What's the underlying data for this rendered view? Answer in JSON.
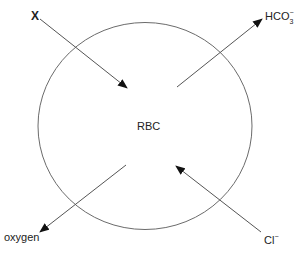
{
  "diagram": {
    "cell": {
      "label": "RBC",
      "shape": "circle",
      "stroke_color": "#6b6b6b"
    },
    "arrows": [
      {
        "id": "x",
        "label": "X",
        "direction": "into cell",
        "from": "top-left"
      },
      {
        "id": "bicarbonate",
        "label_base": "HCO",
        "label_sub": "3",
        "label_sup": "−",
        "direction": "out of cell",
        "to": "top-right"
      },
      {
        "id": "oxygen",
        "label": "oxygen",
        "direction": "out of cell",
        "to": "bottom-left"
      },
      {
        "id": "chloride",
        "label_base": "Cl",
        "label_sup": "−",
        "direction": "into cell",
        "from": "bottom-right"
      }
    ],
    "colors": {
      "line": "#555555",
      "arrowhead": "#111111",
      "text": "#222222"
    }
  }
}
